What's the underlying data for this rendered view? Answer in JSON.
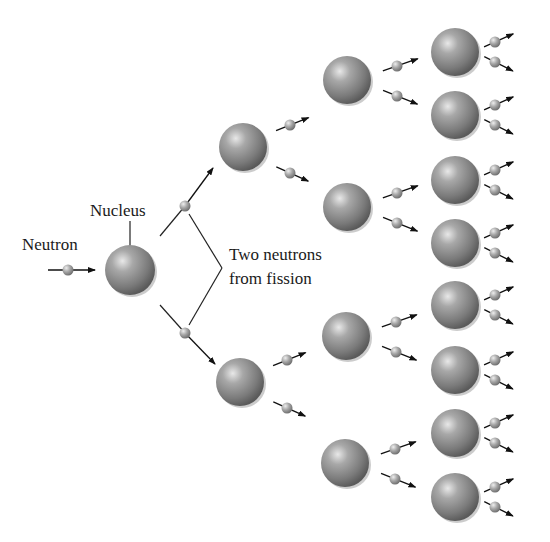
{
  "diagram": {
    "labels": {
      "neutron": "Neutron",
      "nucleus": "Nucleus",
      "two_neutrons_line1": "Two neutrons",
      "two_neutrons_line2": "from fission"
    },
    "colors": {
      "nucleus": "#8c8c8c",
      "neutron": "#a0a0a0",
      "arrow": "#111111",
      "text": "#1a1a1a"
    },
    "incoming_neutron": {
      "x": 68,
      "y": 270
    },
    "root_nucleus": {
      "x": 130,
      "y": 270,
      "r": 25
    },
    "fission_neutrons": [
      {
        "x": 185,
        "y": 206
      },
      {
        "x": 185,
        "y": 333
      }
    ],
    "generation1": [
      {
        "x": 243,
        "y": 147
      },
      {
        "x": 240,
        "y": 382
      }
    ],
    "generation2": [
      {
        "x": 347,
        "y": 80
      },
      {
        "x": 347,
        "y": 207
      },
      {
        "x": 346,
        "y": 336
      },
      {
        "x": 345,
        "y": 463
      }
    ],
    "generation3": [
      {
        "x": 455,
        "y": 52
      },
      {
        "x": 455,
        "y": 115
      },
      {
        "x": 455,
        "y": 180
      },
      {
        "x": 455,
        "y": 243
      },
      {
        "x": 455,
        "y": 305
      },
      {
        "x": 455,
        "y": 370
      },
      {
        "x": 455,
        "y": 433
      },
      {
        "x": 455,
        "y": 497
      }
    ]
  }
}
